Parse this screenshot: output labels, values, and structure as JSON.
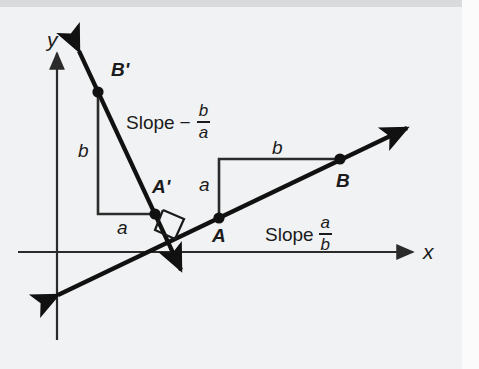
{
  "figure": {
    "background_color": "#f1f2f3",
    "ink_color": "#111111",
    "axes": {
      "x_label": "x",
      "y_label": "y",
      "origin": [
        57,
        252
      ]
    },
    "points": [
      {
        "name": "B-prime",
        "label": "B'",
        "x": 98,
        "y": 92
      },
      {
        "name": "A-prime",
        "label": "A'",
        "x": 155,
        "y": 214
      },
      {
        "name": "A",
        "label": "A",
        "x": 219,
        "y": 218
      },
      {
        "name": "B",
        "label": "B",
        "x": 340,
        "y": 160
      }
    ],
    "leg_labels": {
      "left_vertical": "b",
      "left_horizontal": "a",
      "right_vertical": "a",
      "right_horizontal": "b"
    },
    "slope_labels": [
      {
        "name": "slope-negative-b-over-a",
        "word": "Slope",
        "sign": "−",
        "numerator": "b",
        "denominator": "a"
      },
      {
        "name": "slope-a-over-b",
        "word": "Slope",
        "sign": "",
        "numerator": "a",
        "denominator": "b"
      }
    ],
    "right_angle_marker": "right-angle-square"
  }
}
